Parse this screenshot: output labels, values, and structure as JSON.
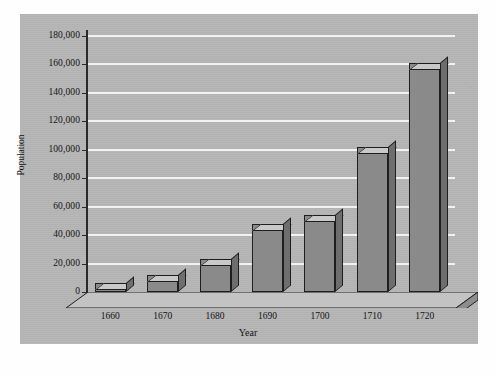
{
  "chart_data": {
    "type": "bar",
    "title": "",
    "xlabel": "Year",
    "ylabel": "Population",
    "categories": [
      "1660",
      "1670",
      "1680",
      "1690",
      "1700",
      "1710",
      "1720"
    ],
    "values": [
      6000,
      12000,
      23000,
      48000,
      54000,
      102000,
      161000
    ],
    "ylim": [
      0,
      180000
    ],
    "ytick_step": 20000,
    "ytick_labels": [
      "0",
      "20,000",
      "40,000",
      "60,000",
      "80,000",
      "100,000",
      "120,000",
      "140,000",
      "160,000",
      "180,000"
    ],
    "ytick_values": [
      0,
      20000,
      40000,
      60000,
      80000,
      100000,
      120000,
      140000,
      160000,
      180000
    ],
    "grid": true,
    "grid_color": "#f2f2f2",
    "legend": null,
    "style": "3d-bars",
    "colors": {
      "panel_background": "#b6b6b6",
      "bar_face": "#8a8a8a",
      "bar_top": "#c9c9c9",
      "bar_side": "#6e6e6e",
      "axis": "#2a2a2a",
      "text": "#121212",
      "page_background": "#ffffff"
    }
  },
  "marks": {
    "edge_speck": "'"
  }
}
